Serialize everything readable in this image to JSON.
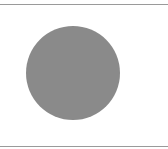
{
  "figure": {
    "background": "#ffffff",
    "border_color": "#9a9a9a",
    "shape": "circle",
    "circle": {
      "cx": 73,
      "cy": 73,
      "r": 47,
      "fill": "#8a8a8a"
    }
  }
}
